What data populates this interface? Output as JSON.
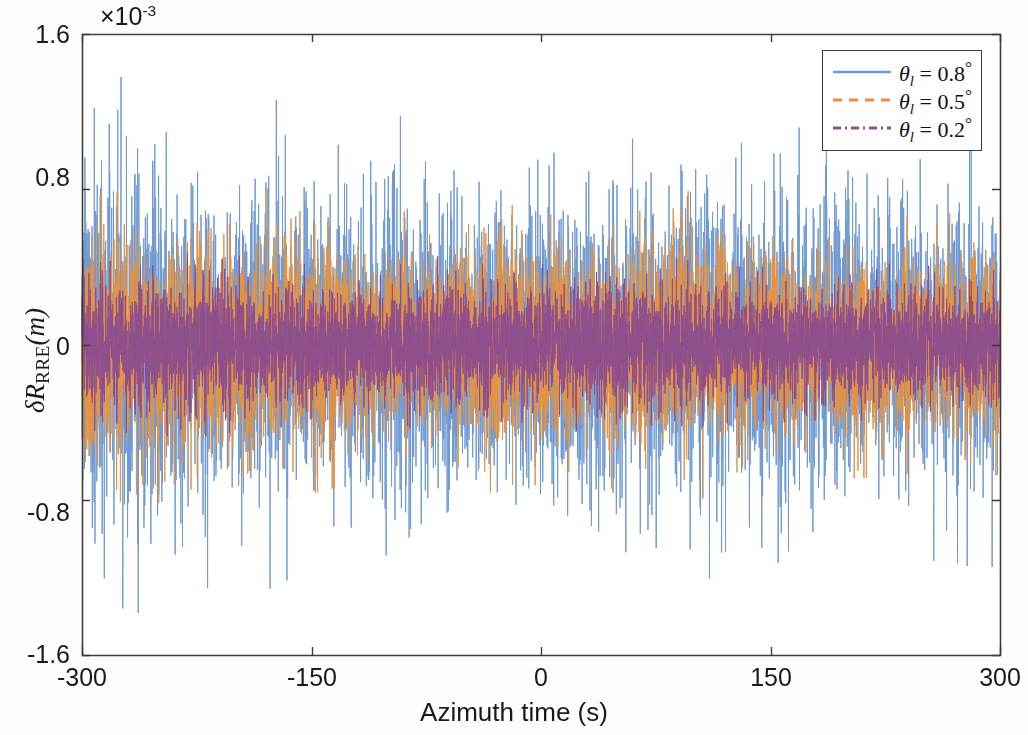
{
  "chart_data": {
    "type": "line",
    "title": "",
    "xlabel": "Azimuth time (s)",
    "ylabel": "δR_RRE(m)",
    "y_exponent_label": "×10",
    "y_exponent_value": "-3",
    "xlim": [
      -300,
      300
    ],
    "ylim": [
      -0.0016,
      0.0016
    ],
    "xticks": [
      -300,
      -150,
      0,
      150,
      300
    ],
    "xticklabels": [
      "-300",
      "-150",
      "0",
      "150",
      "300"
    ],
    "yticks": [
      -0.0016,
      -0.0008,
      0,
      0.0008,
      0.0016
    ],
    "yticklabels": [
      "-1.6",
      "-0.8",
      "0",
      "0.8",
      "1.6"
    ],
    "grid": false,
    "legend_position": "upper right",
    "series": [
      {
        "name": "theta_l = 0.8",
        "label_theta": "θ",
        "label_sub": "l",
        "label_value": "0.8",
        "label_unit": "°",
        "color": "#6f9ad3",
        "linestyle": "solid",
        "amplitude_rms": 0.00032,
        "amplitude_peak": 0.00115,
        "envelope_typical": 0.00085
      },
      {
        "name": "theta_l = 0.5",
        "label_theta": "θ",
        "label_sub": "l",
        "label_value": "0.5",
        "label_unit": "°",
        "color": "#e8923c",
        "linestyle": "dashed",
        "amplitude_rms": 0.0002,
        "amplitude_peak": 0.00072,
        "envelope_typical": 0.00055
      },
      {
        "name": "theta_l = 0.2",
        "label_theta": "θ",
        "label_sub": "l",
        "label_value": "0.2",
        "label_unit": "°",
        "color": "#8e4f8e",
        "linestyle": "dashdot",
        "amplitude_rms": 0.00013,
        "amplitude_peak": 0.00042,
        "envelope_typical": 0.00035
      }
    ]
  },
  "axes": {
    "exponent_prefix": "×10",
    "exponent_sup": "-3",
    "x_title": "Azimuth time (s)",
    "y_title_main": "δR",
    "y_title_sub": "RRE",
    "y_title_tail": "(m)",
    "xticklabels": [
      "-300",
      "-150",
      "0",
      "150",
      "300"
    ],
    "yticklabels": [
      "1.6",
      "0.8",
      "0",
      "-0.8",
      "-1.6"
    ],
    "frame_color": "#3c3c3c",
    "background": "#ffffff"
  },
  "legend": {
    "entries": [
      {
        "theta": "θ",
        "sub": "l",
        "eq": "=",
        "value": "0.8",
        "unit": "°",
        "color": "#6f9ad3",
        "style": "solid"
      },
      {
        "theta": "θ",
        "sub": "l",
        "eq": "=",
        "value": "0.5",
        "unit": "°",
        "color": "#e8923c",
        "style": "dashed"
      },
      {
        "theta": "θ",
        "sub": "l",
        "eq": "=",
        "value": "0.2",
        "unit": "°",
        "color": "#8e4f8e",
        "style": "dashdot"
      }
    ]
  }
}
